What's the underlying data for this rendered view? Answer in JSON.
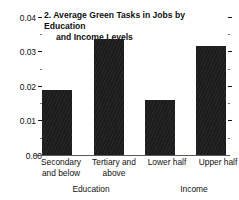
{
  "chart_data": {
    "type": "bar",
    "title": "2. Average Green Tasks in Jobs by Education and Income Levels",
    "title_line1": "2. Average Green Tasks in Jobs by Education",
    "title_line2": "and Income Levels",
    "xlabel": "",
    "ylabel": "",
    "ylim": [
      0,
      0.04
    ],
    "grid": false,
    "legend": "none",
    "categories": [
      "Secondary and below",
      "Tertiary and above",
      "Lower half",
      "Upper half"
    ],
    "values": [
      0.0188,
      0.0336,
      0.0159,
      0.0316
    ],
    "groups": [
      {
        "label": "Education",
        "categories": [
          "Secondary and below",
          "Tertiary and above"
        ]
      },
      {
        "label": "Income",
        "categories": [
          "Lower half",
          "Upper half"
        ]
      }
    ],
    "y_ticks_major": [
      "0.04",
      "0.03",
      "0.02",
      "0.01",
      "0.00"
    ],
    "y_tick_major_values": [
      0.04,
      0.03,
      0.02,
      0.01,
      0.0
    ],
    "y_tick_minor_values": [
      0.035,
      0.025,
      0.015,
      0.005
    ],
    "bar_color": "#1c1c1c",
    "axis_color": "#5a5a5a",
    "background": "#ffffff"
  },
  "axis": {
    "ticks": [
      {
        "label": "0.04",
        "value": 0.04
      },
      {
        "label": "",
        "value": 0.035
      },
      {
        "label": "0.03",
        "value": 0.03
      },
      {
        "label": "",
        "value": 0.025
      },
      {
        "label": "0.02",
        "value": 0.02
      },
      {
        "label": "",
        "value": 0.015
      },
      {
        "label": "0.01",
        "value": 0.01
      },
      {
        "label": "",
        "value": 0.005
      },
      {
        "label": "0.00",
        "value": 0.0
      }
    ]
  },
  "labels": {
    "cat0_line1": "Secondary",
    "cat0_line2": "and below",
    "cat1_line1": "Tertiary and",
    "cat1_line2": "above",
    "cat2_line1": "Lower half",
    "cat3_line1": "Upper half",
    "group0": "Education",
    "group1": "Income"
  }
}
